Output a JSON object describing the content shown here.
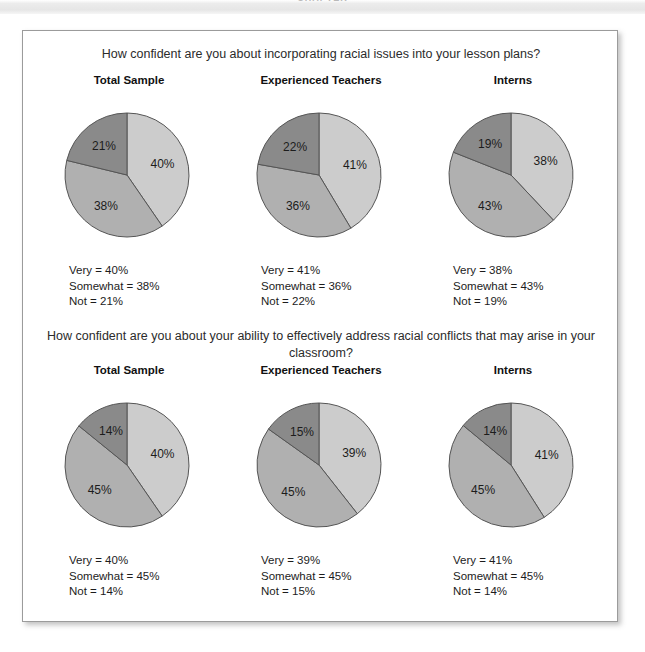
{
  "top_band": {
    "clipped_text": "CHAPTER"
  },
  "figure": {
    "questions": [
      "How confident are you about incorporating racial issues into your lesson plans?",
      "How confident are you about your ability to effectively address racial conflicts that may arise in your classroom?"
    ],
    "legend_labels": {
      "very": "Very",
      "somewhat": "Somewhat",
      "not": "Not"
    },
    "colors": {
      "very": "#cccccc",
      "somewhat": "#b0b0b0",
      "not": "#8a8a8a",
      "outline": "#555555",
      "border": "#9b9b9b"
    }
  },
  "chart_data": [
    {
      "type": "pie",
      "title": "Total Sample",
      "question": "How confident are you about incorporating racial issues into your lesson plans?",
      "labels": [
        "Very",
        "Somewhat",
        "Not"
      ],
      "values": [
        40,
        38,
        21
      ],
      "value_labels": [
        "40%",
        "38%",
        "21%"
      ],
      "colors": [
        "#cccccc",
        "#b0b0b0",
        "#8a8a8a"
      ],
      "legend": [
        "Very = 40%",
        "Somewhat = 38%",
        "Not = 21%"
      ]
    },
    {
      "type": "pie",
      "title": "Experienced Teachers",
      "question": "How confident are you about incorporating racial issues into your lesson plans?",
      "labels": [
        "Very",
        "Somewhat",
        "Not"
      ],
      "values": [
        41,
        36,
        22
      ],
      "value_labels": [
        "41%",
        "36%",
        "22%"
      ],
      "colors": [
        "#cccccc",
        "#b0b0b0",
        "#8a8a8a"
      ],
      "legend": [
        "Very = 41%",
        "Somewhat = 36%",
        "Not = 22%"
      ]
    },
    {
      "type": "pie",
      "title": "Interns",
      "question": "How confident are you about incorporating racial issues into your lesson plans?",
      "labels": [
        "Very",
        "Somewhat",
        "Not"
      ],
      "values": [
        38,
        43,
        19
      ],
      "value_labels": [
        "38%",
        "43%",
        "19%"
      ],
      "colors": [
        "#cccccc",
        "#b0b0b0",
        "#8a8a8a"
      ],
      "legend": [
        "Very = 38%",
        "Somewhat = 43%",
        "Not = 19%"
      ]
    },
    {
      "type": "pie",
      "title": "Total Sample",
      "question": "How confident are you about your ability to effectively address racial conflicts that may arise in your classroom?",
      "labels": [
        "Very",
        "Somewhat",
        "Not"
      ],
      "values": [
        40,
        45,
        14
      ],
      "value_labels": [
        "40%",
        "45%",
        "14%"
      ],
      "colors": [
        "#cccccc",
        "#b0b0b0",
        "#8a8a8a"
      ],
      "legend": [
        "Very = 40%",
        "Somewhat = 45%",
        "Not = 14%"
      ]
    },
    {
      "type": "pie",
      "title": "Experienced Teachers",
      "question": "How confident are you about your ability to effectively address racial conflicts that may arise in your classroom?",
      "labels": [
        "Very",
        "Somewhat",
        "Not"
      ],
      "values": [
        39,
        45,
        15
      ],
      "value_labels": [
        "39%",
        "45%",
        "15%"
      ],
      "colors": [
        "#cccccc",
        "#b0b0b0",
        "#8a8a8a"
      ],
      "legend": [
        "Very = 39%",
        "Somewhat = 45%",
        "Not = 15%"
      ]
    },
    {
      "type": "pie",
      "title": "Interns",
      "question": "How confident are you about your ability to effectively address racial conflicts that may arise in your classroom?",
      "labels": [
        "Very",
        "Somewhat",
        "Not"
      ],
      "values": [
        41,
        45,
        14
      ],
      "value_labels": [
        "41%",
        "45%",
        "14%"
      ],
      "colors": [
        "#cccccc",
        "#b0b0b0",
        "#8a8a8a"
      ],
      "legend": [
        "Very = 41%",
        "Somewhat = 45%",
        "Not = 14%"
      ]
    }
  ]
}
